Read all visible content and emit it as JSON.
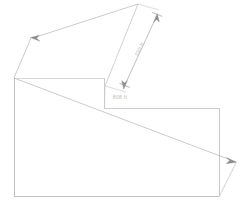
{
  "drawing": {
    "title": "Parcel boundary sketch with dimension callouts",
    "background_color": "#ffffff",
    "line_color": "#a8a8a8",
    "line_color_faint": "#c2c2c2",
    "text_color": "#bdbdbd",
    "stroke_width": 0.7,
    "canvas": {
      "width": 244,
      "height": 205
    },
    "dimensions": [
      {
        "id": "dim-upper-right",
        "label": "250 ft",
        "value": 250,
        "unit": "ft",
        "orientation": "diagonal",
        "text_x": 141,
        "text_y": 50,
        "text_rotation": -64,
        "extension_from": {
          "x": 138,
          "y": 4
        },
        "extension_to": {
          "x": 105,
          "y": 85
        },
        "dim_line_start": {
          "x": 157,
          "y": 14
        },
        "dim_line_end": {
          "x": 125,
          "y": 88
        }
      },
      {
        "id": "dim-center",
        "label": "808 ft",
        "value": 808,
        "unit": "ft",
        "orientation": "horizontal",
        "text_x": 120,
        "text_y": 99,
        "text_rotation": 0,
        "dim_line_start": {
          "x": 104,
          "y": 104
        },
        "dim_line_end": {
          "x": 160,
          "y": 104
        }
      }
    ],
    "shape": {
      "name": "parcel-outline",
      "description": "L-shaped / stepped polygon boundary",
      "vertices": [
        {
          "x": 14,
          "y": 78
        },
        {
          "x": 104,
          "y": 78
        },
        {
          "x": 104,
          "y": 108
        },
        {
          "x": 219,
          "y": 108
        },
        {
          "x": 219,
          "y": 196
        },
        {
          "x": 14,
          "y": 196
        }
      ]
    },
    "leaders": [
      {
        "id": "leader-upper-left",
        "description": "Arrow leader pointing to upper-left toward boundary",
        "tip": {
          "x": 31,
          "y": 38
        },
        "tail": {
          "x": 14,
          "y": 78
        },
        "second_tail": {
          "x": 138,
          "y": 4
        }
      },
      {
        "id": "leader-lower-right",
        "description": "Arrow leader pointing to lower-right toward boundary",
        "tip": {
          "x": 236,
          "y": 162
        },
        "tail": {
          "x": 219,
          "y": 196
        },
        "second_tail": {
          "x": 31,
          "y": 38
        }
      }
    ]
  }
}
